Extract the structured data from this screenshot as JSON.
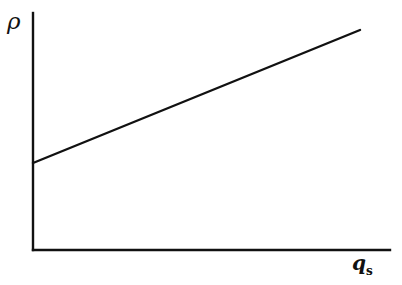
{
  "figure": {
    "background_color": "#ffffff",
    "ink_color": "#111111",
    "width": 402,
    "height": 285
  },
  "axes": {
    "y_axis_label": "ρ",
    "x_axis_label_base": "q",
    "x_axis_label_subscript": "s",
    "y_axis": {
      "x": 33,
      "y_top": 13,
      "y_bottom": 250,
      "width": 2.4
    },
    "x_axis": {
      "y": 250,
      "x_left": 33,
      "x_right": 390,
      "width": 2.4
    }
  },
  "chart_data": {
    "type": "line",
    "title": "",
    "xlabel": "q_s",
    "ylabel": "ρ",
    "grid": false,
    "legend": null,
    "axis_ticks": {
      "x": [],
      "y": []
    },
    "xlim": [
      0,
      1
    ],
    "ylim": [
      0,
      1
    ],
    "series": [
      {
        "name": "rho vs q_s",
        "color": "#111111",
        "line_width": 2.4,
        "x": [
          0.0,
          1.0
        ],
        "y": [
          0.366,
          0.924
        ],
        "pixel_points": [
          {
            "x": 33,
            "y": 163
          },
          {
            "x": 360,
            "y": 30
          }
        ],
        "slope_pixels": -0.4067,
        "intercept_fraction_of_height": 0.366
      }
    ]
  }
}
